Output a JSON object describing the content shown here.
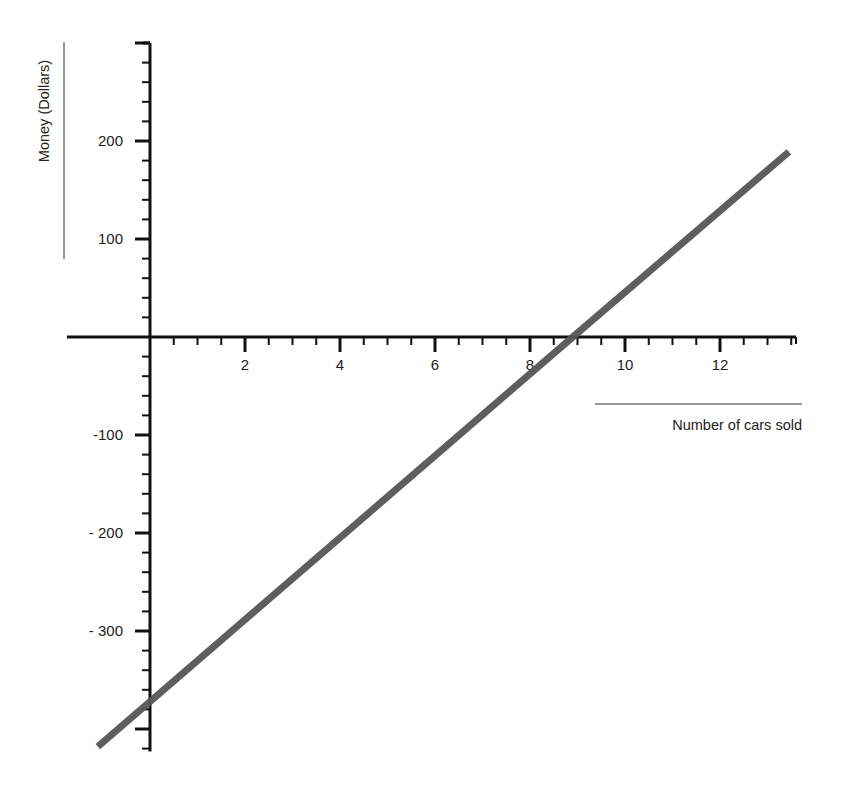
{
  "chart_data": {
    "type": "line",
    "title": "",
    "xlabel": "Number of cars sold",
    "ylabel": "Money (Dollars)",
    "xlim": [
      -1.75,
      13.6
    ],
    "ylim": [
      -420,
      300
    ],
    "grid": false,
    "legend": null,
    "x_ticks": [
      2,
      4,
      6,
      8,
      10,
      12
    ],
    "x_tick_labels": [
      "2",
      "4",
      "6",
      "8",
      "10",
      "12"
    ],
    "x_minor_step": 0.5,
    "y_ticks": [
      200,
      100,
      -100,
      -200,
      -300
    ],
    "y_tick_labels": [
      "200",
      "100",
      "-100",
      "- 200",
      "- 300"
    ],
    "y_minor_step": 20,
    "series": [
      {
        "name": "Money vs cars sold",
        "color": "#555555",
        "x": [
          -1.1,
          0,
          8.9,
          13.45
        ],
        "y": [
          -418,
          -372,
          0,
          189
        ]
      }
    ],
    "annotations": {
      "y_intercept": -372,
      "x_intercept": 8.9,
      "slope_per_car": 41.7
    }
  },
  "colors": {
    "axis": "#111111",
    "line": "#555555",
    "text": "#222222"
  }
}
